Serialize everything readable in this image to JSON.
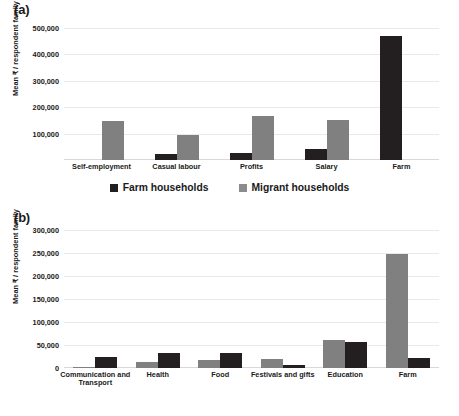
{
  "figure": {
    "panel_a_label": "(a)",
    "panel_b_label": "(b)",
    "colors": {
      "farm_households": "#231f20",
      "migrant_households": "#808080",
      "gridline": "#e9e9e9",
      "background": "#ffffff"
    },
    "legend": {
      "farm_label": "Farm households",
      "migrant_label": "Migrant households"
    }
  },
  "chart_data": [
    {
      "type": "bar",
      "panel": "(a)",
      "title": "",
      "xlabel": "",
      "ylabel": "Mean ₹ / respondent family",
      "categories": [
        "Self-employment",
        "Casual labour",
        "Profits",
        "Salary",
        "Farm"
      ],
      "series": [
        {
          "name": "Farm households",
          "color": "#231f20",
          "values": [
            0,
            22000,
            25000,
            42000,
            470000
          ]
        },
        {
          "name": "Migrant households",
          "color": "#808080",
          "values": [
            148000,
            95000,
            168000,
            150000,
            0
          ]
        }
      ],
      "ylim": [
        0,
        500000
      ],
      "yticks": [
        100000,
        200000,
        300000,
        400000,
        500000
      ],
      "ytick_labels": [
        "100,000",
        "200,000",
        "300,000",
        "400,000",
        "500,000"
      ],
      "grid": true,
      "legend_position": "bottom",
      "bar_order": [
        "Farm households",
        "Migrant households"
      ]
    },
    {
      "type": "bar",
      "panel": "(b)",
      "title": "",
      "xlabel": "",
      "ylabel": "Mean ₹ / respondent family",
      "categories": [
        "Communication and\nTransport",
        "Health",
        "Food",
        "Festivals and gifts",
        "Education",
        "Farm"
      ],
      "series": [
        {
          "name": "Migrant households",
          "color": "#808080",
          "values": [
            2000,
            12000,
            17000,
            20000,
            60000,
            248000
          ]
        },
        {
          "name": "Farm households",
          "color": "#231f20",
          "values": [
            23000,
            32000,
            32000,
            6000,
            57000,
            21000
          ]
        }
      ],
      "ylim": [
        0,
        300000
      ],
      "yticks": [
        0,
        50000,
        100000,
        150000,
        200000,
        250000,
        300000
      ],
      "ytick_labels": [
        "0",
        "50,000",
        "100,000",
        "150,000",
        "200,000",
        "250,000",
        "300,000"
      ],
      "grid": true,
      "legend_position": "bottom",
      "bar_order": [
        "Migrant households",
        "Farm households"
      ]
    }
  ]
}
